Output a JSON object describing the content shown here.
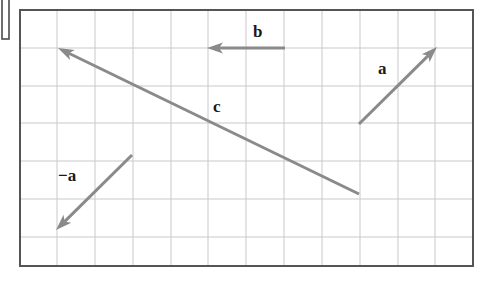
{
  "figure": {
    "type": "vector-diagram",
    "background_color": "#ffffff",
    "canvas": {
      "width": 480,
      "height": 282
    },
    "crop_artifact": {
      "name": "cropped-box-fragment",
      "x": 2,
      "y": 0,
      "width": 7,
      "height": 39,
      "color": "#4a4a4a"
    },
    "frame": {
      "x": 20,
      "y": 10,
      "width": 453,
      "height": 256,
      "border_color": "#555555",
      "border_width": 2
    },
    "grid": {
      "line_color": "#c9c9c9",
      "line_width": 1,
      "cell_size": 37.8,
      "columns": 12,
      "rows": 7,
      "vertical_lines": [
        57,
        95,
        133,
        171,
        208,
        246,
        284,
        322,
        360,
        398,
        435
      ],
      "horizontal_lines": [
        48,
        86,
        123,
        161,
        199,
        237
      ]
    },
    "arrow_style": {
      "color": "#8a8a8a",
      "stroke_width": 3,
      "head_length": 16,
      "head_width": 11
    },
    "vectors": [
      {
        "id": "a",
        "label": "a",
        "label_x": 378,
        "label_y": 60,
        "tail": {
          "x": 359,
          "y": 124
        },
        "tip": {
          "x": 437,
          "y": 47
        },
        "components": {
          "dx": 2,
          "dy": 2
        },
        "direction": "up-right"
      },
      {
        "id": "b",
        "label": "b",
        "label_x": 253,
        "label_y": 23,
        "tail": {
          "x": 285,
          "y": 48
        },
        "tip": {
          "x": 207,
          "y": 48
        },
        "components": {
          "dx": -2,
          "dy": 0
        },
        "direction": "left"
      },
      {
        "id": "c",
        "label": "c",
        "label_x": 213,
        "label_y": 98,
        "tail": {
          "x": 359,
          "y": 194
        },
        "tip": {
          "x": 58,
          "y": 48
        },
        "components": {
          "dx": -8,
          "dy": 4
        },
        "direction": "up-left"
      },
      {
        "id": "minus-a",
        "label": "−a",
        "label_x": 58,
        "label_y": 167,
        "tail": {
          "x": 132,
          "y": 155
        },
        "tip": {
          "x": 56,
          "y": 230
        },
        "components": {
          "dx": -2,
          "dy": -2
        },
        "direction": "down-left"
      }
    ]
  }
}
